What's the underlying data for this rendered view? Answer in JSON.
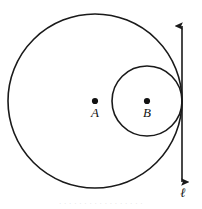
{
  "figure": {
    "type": "geometry-diagram",
    "width": 202,
    "height": 209,
    "background_color": "#ffffff",
    "stroke_color": "#1a1a1a"
  },
  "shapes": {
    "large_circle": {
      "name": "circle-A",
      "center_label": "A",
      "cx": 95,
      "cy": 101,
      "r": 87,
      "stroke_width": 1.6
    },
    "small_circle": {
      "name": "circle-B",
      "center_label": "B",
      "cx": 147,
      "cy": 101,
      "r": 35,
      "stroke_width": 1.6
    },
    "tangent_line": {
      "name": "line-ell",
      "label": "ℓ",
      "x": 182,
      "y_top": 26,
      "y_bottom": 182,
      "stroke_width": 1.6,
      "arrowheads": "both",
      "label_x": 183,
      "label_y": 197
    }
  },
  "points": [
    {
      "id": "point-a",
      "label": "A",
      "dot_cx": 95,
      "dot_cy": 101,
      "dot_r": 3.1,
      "label_x": 95,
      "label_y": 117,
      "font_size": 13
    },
    {
      "id": "point-b",
      "label": "B",
      "dot_cx": 147,
      "dot_cy": 101,
      "dot_r": 3.1,
      "label_x": 147,
      "label_y": 117,
      "font_size": 13
    }
  ],
  "caption": {
    "partial_text": "· · ·   · · · ·   · · ·   · · · ·   · · ·"
  }
}
